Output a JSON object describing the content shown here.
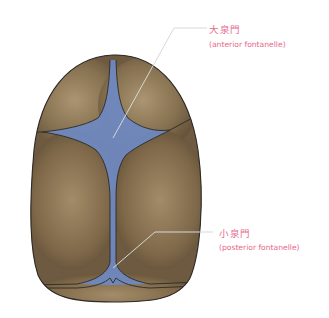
{
  "diagram": {
    "colors": {
      "bone": "#7a6447",
      "bone_highlight": "#a89270",
      "bone_outline": "#2e2a26",
      "fontanelle": "#6f88bf",
      "label_text": "#e8698a",
      "leader_line": "#b9b9b9"
    },
    "labels": [
      {
        "id": "anterior",
        "japanese": "大泉門",
        "english": "(anterior fontanelle)"
      },
      {
        "id": "posterior",
        "japanese": "小泉門",
        "english": "(posterior fontanelle)"
      }
    ]
  }
}
